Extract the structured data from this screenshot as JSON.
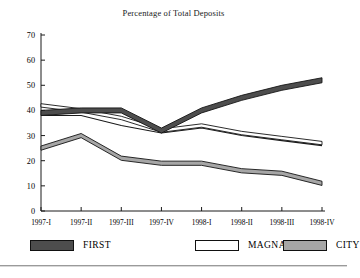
{
  "chart_data": {
    "type": "line",
    "title": "Percentage of Total Deposits",
    "xlabel": "",
    "ylabel": "",
    "ylim": [
      0,
      70
    ],
    "ytick_values": [
      0,
      10,
      20,
      30,
      40,
      50,
      60,
      70
    ],
    "ytick_labels": [
      "0",
      "10",
      "20",
      "30",
      "40",
      "50",
      "60",
      "70"
    ],
    "grid": false,
    "legend_position": "bottom",
    "categories": [
      "1997-I",
      "1997-II",
      "1997-III",
      "1997-IV",
      "1998-I",
      "1998-II",
      "1998-III",
      "1998-IV"
    ],
    "series": [
      {
        "name": "FIRST",
        "color": "#4d4d4d",
        "values": [
          39,
          40,
          40,
          32,
          40,
          45,
          49,
          52
        ]
      },
      {
        "name": "MAGNA",
        "color": "#ffffff",
        "values": [
          42,
          40,
          37,
          32,
          34,
          31,
          29,
          27
        ]
      },
      {
        "name": "CITY",
        "color": "#a6a6a6",
        "values": [
          25,
          30,
          21,
          19,
          19,
          16,
          15,
          11
        ]
      }
    ],
    "extra_series": [
      {
        "name": "MAGNA-lower-edge",
        "color": "#1a1a1a",
        "values": [
          38,
          38,
          34,
          31,
          33,
          30,
          28,
          26
        ]
      }
    ]
  },
  "legend": {
    "items": [
      {
        "label": "FIRST",
        "color": "#4d4d4d"
      },
      {
        "label": "MAGNA",
        "color": "#ffffff"
      },
      {
        "label": "CITY",
        "color": "#a6a6a6"
      }
    ]
  },
  "axis": {
    "line_color": "#1a1a1a"
  }
}
